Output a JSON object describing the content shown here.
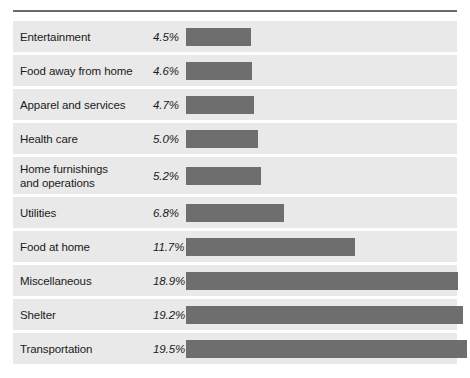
{
  "chart_data": {
    "type": "bar",
    "title": "",
    "subtitle": "",
    "xlabel": "",
    "ylabel": "",
    "orientation": "horizontal",
    "grid": false,
    "legend": "none",
    "value_suffix": "%",
    "xlim": [
      0,
      19.5
    ],
    "categories": [
      "Entertainment",
      "Food away from home",
      "Apparel and services",
      "Health care",
      "Home furnishings and operations",
      "Utilities",
      "Food at home",
      "Miscellaneous",
      "Shelter",
      "Transportation"
    ],
    "values": [
      4.5,
      4.6,
      4.7,
      5.0,
      5.2,
      6.8,
      11.7,
      18.9,
      19.2,
      19.5
    ],
    "value_labels": [
      "4.5%",
      "4.6%",
      "4.7%",
      "5.0%",
      "5.2%",
      "6.8%",
      "11.7%",
      "18.9%",
      "19.2%",
      "19.5%"
    ],
    "colors": {
      "bar": "#6e6e6e",
      "row_background": "#e9e9e9",
      "row_divider": "#ffffff",
      "rule": "#6a6a6a",
      "text": "#1a1a1a",
      "page_background": "#ffffff"
    }
  },
  "rows": [
    {
      "label": "Entertainment",
      "label_line1": "Entertainment",
      "label_line2": "",
      "value_label": "4.5%",
      "value": 4.5
    },
    {
      "label": "Food away from home",
      "label_line1": "Food away from home",
      "label_line2": "",
      "value_label": "4.6%",
      "value": 4.6
    },
    {
      "label": "Apparel and services",
      "label_line1": "Apparel and services",
      "label_line2": "",
      "value_label": "4.7%",
      "value": 4.7
    },
    {
      "label": "Health care",
      "label_line1": "Health care",
      "label_line2": "",
      "value_label": "5.0%",
      "value": 5.0
    },
    {
      "label": "Home furnishings and operations",
      "label_line1": "Home furnishings",
      "label_line2": "and operations",
      "value_label": "5.2%",
      "value": 5.2
    },
    {
      "label": "Utilities",
      "label_line1": "Utilities",
      "label_line2": "",
      "value_label": "6.8%",
      "value": 6.8
    },
    {
      "label": "Food at home",
      "label_line1": "Food at home",
      "label_line2": "",
      "value_label": "11.7%",
      "value": 11.7
    },
    {
      "label": "Miscellaneous",
      "label_line1": "Miscellaneous",
      "label_line2": "",
      "value_label": "18.9%",
      "value": 18.9
    },
    {
      "label": "Shelter",
      "label_line1": "Shelter",
      "label_line2": "",
      "value_label": "19.2%",
      "value": 19.2
    },
    {
      "label": "Transportation",
      "label_line1": "Transportation",
      "label_line2": "",
      "value_label": "19.5%",
      "value": 19.5
    }
  ]
}
